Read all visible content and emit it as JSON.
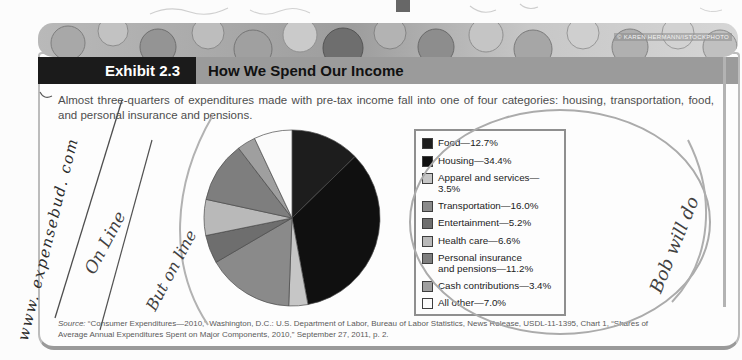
{
  "page": {
    "photo_credit": "© KAREN HERMANN/ISTOCKPHOTO",
    "exhibit_label": "Exhibit 2.3",
    "exhibit_title": "How We Spend Our Income",
    "intro": "Almost three-quarters of expenditures made with pre-tax income fall into one of four categories: housing, transportation, food, and personal insurance and pensions.",
    "source_prefix": "Source:",
    "source_line1": "“Consumer Expenditures—2010,” Washington, D.C.: U.S. Department of Labor, Bureau of Labor Statistics, News Release, USDL-11-1395, Chart 1, “Shares of",
    "source_line2": "Average Annual Expenditures Spent on Major Components, 2010,” September 27, 2011, p. 2."
  },
  "annotations": {
    "left_margin_handwriting": "www. expensebud. com",
    "scribble_1": "On Line",
    "scribble_2": "But on line",
    "scribble_3": "Bob will do"
  },
  "chart_data": {
    "type": "pie",
    "title": "How We Spend Our Income",
    "categories": [
      "Food",
      "Housing",
      "Apparel and services",
      "Transportation",
      "Entertainment",
      "Health care",
      "Personal insurance and pensions",
      "Cash contributions",
      "All other"
    ],
    "values": [
      12.7,
      34.4,
      3.5,
      16.0,
      5.2,
      6.6,
      11.2,
      3.4,
      7.0
    ],
    "legend_labels": [
      "Food—12.7%",
      "Housing—34.4%",
      "Apparel and services—3.5%",
      "Transportation—16.0%",
      "Entertainment—5.2%",
      "Health care—6.6%",
      "Personal insurance\nand pensions—11.2%",
      "Cash contributions—3.4%",
      "All other—7.0%"
    ],
    "colors": [
      "#1d1d1d",
      "#101010",
      "#c6c6c6",
      "#8a8a8a",
      "#6e6e6e",
      "#b9b9b9",
      "#7e7e7e",
      "#9f9f9f",
      "#fbfbfb"
    ],
    "slice_outline_color": "#4a4a4a",
    "legend_position": "right",
    "start_angle_deg": 0,
    "direction": "clockwise"
  }
}
